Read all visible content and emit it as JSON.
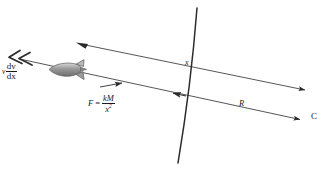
{
  "figure": {
    "type": "physics-free-body-diagram",
    "background_color": "#ffffff",
    "line_color": "#2b2b2b",
    "rocket_color": "#8c8c8c"
  },
  "labels": {
    "velocity": {
      "symbol": "v",
      "numerator": "dv",
      "denominator": "dx",
      "meaning": "v dv/dx"
    },
    "force": {
      "lhs": "F",
      "equals": "=",
      "numerator": "kM",
      "denominator_base": "x",
      "denominator_exponent": "2",
      "meaning": "F = kM / x^2"
    },
    "distance_x": "x",
    "distance_R": "R",
    "centre": "C"
  },
  "geometry": {
    "upper_line": {
      "x1": 76,
      "y1": 43,
      "x2": 311,
      "y2": 91,
      "arrow_start": "left",
      "arrow_end": "right"
    },
    "lower_line": {
      "x1": 8,
      "y1": 57,
      "x2": 306,
      "y2": 121,
      "arrow_start": "double-chevron-left",
      "arrow_end": "right"
    },
    "arc": {
      "top_x": 197,
      "top_y": 8,
      "bottom_x": 178,
      "bottom_y": 163,
      "bulge_x": 191
    },
    "force_arrow": {
      "x1": 103,
      "y1": 87,
      "x2": 127,
      "y2": 82,
      "direction": "right"
    },
    "inner_arrow": {
      "x1": 185,
      "y1": 95,
      "x2": 167,
      "y2": 92,
      "direction": "left"
    },
    "rocket": {
      "cx": 65,
      "cy": 70,
      "heading": "left"
    }
  }
}
